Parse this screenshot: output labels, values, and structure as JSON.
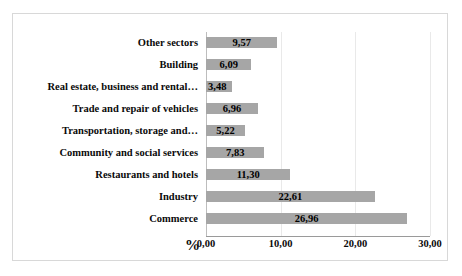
{
  "chart_data": {
    "type": "bar",
    "orientation": "horizontal",
    "title": "",
    "xlabel": "%",
    "ylabel": "",
    "xlim": [
      0,
      30
    ],
    "xticks": [
      "0,00",
      "10,00",
      "20,00",
      "30,00"
    ],
    "xtick_values": [
      0,
      10,
      20,
      30
    ],
    "grid": true,
    "legend": false,
    "categories": [
      "Other sectors",
      "Building",
      "Real estate, business and rental…",
      "Trade and repair of vehicles",
      "Transportation, storage and…",
      "Community and social services",
      "Restaurants and hotels",
      "Industry",
      "Commerce"
    ],
    "values": [
      9.57,
      6.09,
      3.48,
      6.96,
      5.22,
      7.83,
      11.3,
      22.61,
      26.96
    ],
    "value_labels": [
      "9,57",
      "6,09",
      "3,48",
      "6,96",
      "5,22",
      "7,83",
      "11,30",
      "22,61",
      "26,96"
    ],
    "bar_color": "#a6a6a6",
    "label_color": "#000000",
    "gridline_color": "#e9e9e9",
    "axis_color": "#9a9a9a",
    "border_color": "#d8d8d8",
    "background": "#ffffff"
  }
}
